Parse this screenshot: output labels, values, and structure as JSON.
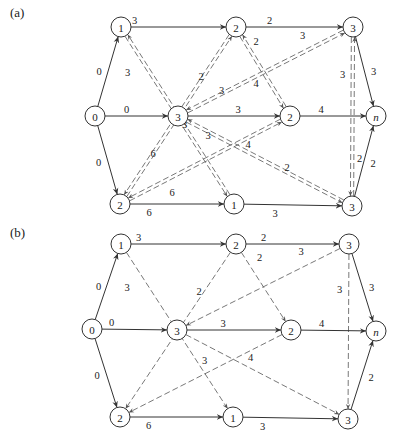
{
  "figure": {
    "panels": [
      {
        "id": "a",
        "label": "(a)",
        "nodes": [
          {
            "id": "s",
            "label": "0"
          },
          {
            "id": "t1",
            "label": "1"
          },
          {
            "id": "t2",
            "label": "2"
          },
          {
            "id": "t3",
            "label": "3"
          },
          {
            "id": "m3",
            "label": "3"
          },
          {
            "id": "m2",
            "label": "2"
          },
          {
            "id": "n",
            "label": "n"
          },
          {
            "id": "b2",
            "label": "2"
          },
          {
            "id": "b1",
            "label": "1"
          },
          {
            "id": "b3",
            "label": "3"
          }
        ],
        "solid_edges": [
          {
            "from": "s",
            "to": "t1",
            "label": "0"
          },
          {
            "from": "s",
            "to": "m3",
            "label": "0"
          },
          {
            "from": "s",
            "to": "b2",
            "label": "0"
          },
          {
            "from": "t1",
            "to": "t2",
            "label": "3"
          },
          {
            "from": "t2",
            "to": "t3",
            "label": "2"
          },
          {
            "from": "t3",
            "to": "n",
            "label": "3"
          },
          {
            "from": "m3",
            "to": "m2",
            "label": "3"
          },
          {
            "from": "m2",
            "to": "n",
            "label": "4"
          },
          {
            "from": "b2",
            "to": "b1",
            "label": "6"
          },
          {
            "from": "b1",
            "to": "b3",
            "label": "3"
          },
          {
            "from": "b3",
            "to": "n",
            "label": "2"
          }
        ],
        "dashed_edge_pairs": [
          {
            "a": "t1",
            "b": "b1",
            "label": "3",
            "label2": "3"
          },
          {
            "a": "b2",
            "b": "t2",
            "label": "2",
            "label2": "6"
          },
          {
            "a": "t2",
            "b": "m2",
            "label": "2",
            "label2": "4"
          },
          {
            "a": "t3",
            "b": "m3",
            "label": "3",
            "label2": "3"
          },
          {
            "a": "b2",
            "b": "m2",
            "label": "4",
            "label2": "6"
          },
          {
            "a": "m3",
            "b": "b3",
            "label": "3",
            "label2": "2"
          },
          {
            "a": "t3",
            "b": "b3",
            "label": "3",
            "label2": "2"
          }
        ]
      },
      {
        "id": "b",
        "label": "(b)",
        "nodes": [
          {
            "id": "s",
            "label": "0"
          },
          {
            "id": "t1",
            "label": "1"
          },
          {
            "id": "t2",
            "label": "2"
          },
          {
            "id": "t3",
            "label": "3"
          },
          {
            "id": "m3",
            "label": "3"
          },
          {
            "id": "m2",
            "label": "2"
          },
          {
            "id": "n",
            "label": "n"
          },
          {
            "id": "b2",
            "label": "2"
          },
          {
            "id": "b1",
            "label": "1"
          },
          {
            "id": "b3",
            "label": "3"
          }
        ],
        "solid_edges": [
          {
            "from": "s",
            "to": "t1",
            "label": "0"
          },
          {
            "from": "s",
            "to": "m3",
            "label": "0"
          },
          {
            "from": "s",
            "to": "b2",
            "label": "0"
          },
          {
            "from": "t1",
            "to": "t2",
            "label": "3"
          },
          {
            "from": "t2",
            "to": "t3",
            "label": "2"
          },
          {
            "from": "t3",
            "to": "n",
            "label": "3"
          },
          {
            "from": "m3",
            "to": "m2",
            "label": "3"
          },
          {
            "from": "m2",
            "to": "n",
            "label": "4"
          },
          {
            "from": "b2",
            "to": "b1",
            "label": "6"
          },
          {
            "from": "b1",
            "to": "b3",
            "label": "3"
          },
          {
            "from": "b3",
            "to": "n",
            "label": "2"
          }
        ],
        "dashed_edges": [
          {
            "from": "t1",
            "to": "b1",
            "label": "3"
          },
          {
            "from": "t2",
            "to": "b2",
            "label": "2"
          },
          {
            "from": "t2",
            "to": "m2",
            "label": "2"
          },
          {
            "from": "t3",
            "to": "m3",
            "label": "3"
          },
          {
            "from": "m2",
            "to": "b2",
            "label": "4"
          },
          {
            "from": "m3",
            "to": "b3",
            "label": "3"
          },
          {
            "from": "t3",
            "to": "b3",
            "label": "3"
          }
        ]
      }
    ]
  }
}
